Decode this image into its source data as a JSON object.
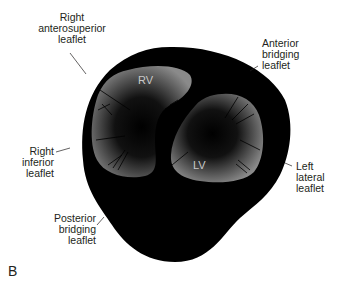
{
  "figure": {
    "panel_letter": "B",
    "chambers": {
      "rv": "RV",
      "lv": "LV"
    },
    "labels": {
      "right_anterosuperior": [
        "Right",
        "anterosuperior",
        "leaflet"
      ],
      "anterior_bridging": [
        "Anterior",
        "bridging",
        "leaflet"
      ],
      "right_inferior": [
        "Right",
        "inferior",
        "leaflet"
      ],
      "left_lateral": [
        "Left",
        "lateral",
        "leaflet"
      ],
      "posterior_bridging": [
        "Posterior",
        "bridging",
        "leaflet"
      ]
    },
    "colors": {
      "outer_shape": "#000000",
      "chamber_light": "#8a8a8a",
      "label_text": "#231f20",
      "chamber_text": "#c9c9c9"
    }
  }
}
